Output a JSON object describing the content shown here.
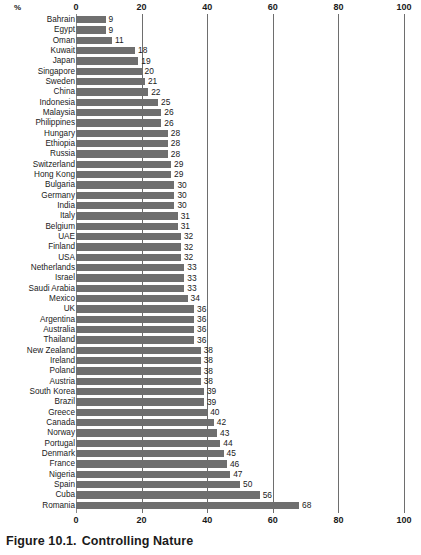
{
  "figure": {
    "caption_number": "Figure 10.1.",
    "caption_title": "Controlling Nature",
    "unit_label": "%"
  },
  "chart_data": {
    "type": "bar",
    "orientation": "horizontal",
    "title": "Controlling Nature",
    "subtitle": "",
    "xlabel": "%",
    "ylabel": "",
    "xlim": [
      0,
      100
    ],
    "xticks": [
      0,
      20,
      40,
      60,
      80,
      100
    ],
    "xtick_labels": [
      "0",
      "20",
      "40",
      "60",
      "80",
      "100"
    ],
    "grid": true,
    "legend": null,
    "bar_color": "#6f6f6f",
    "value_labels_shown": true,
    "categories": [
      "Bahrain",
      "Egypt",
      "Oman",
      "Kuwait",
      "Japan",
      "Singapore",
      "Sweden",
      "China",
      "Indonesia",
      "Malaysia",
      "Philippines",
      "Hungary",
      "Ethiopia",
      "Russia",
      "Switzerland",
      "Hong Kong",
      "Bulgaria",
      "Germany",
      "India",
      "Italy",
      "Belgium",
      "UAE",
      "Finland",
      "USA",
      "Netherlands",
      "Israel",
      "Saudi Arabia",
      "Mexico",
      "UK",
      "Argentina",
      "Australia",
      "Thailand",
      "New Zealand",
      "Ireland",
      "Poland",
      "Austria",
      "South Korea",
      "Brazil",
      "Greece",
      "Canada",
      "Norway",
      "Portugal",
      "Denmark",
      "France",
      "Nigeria",
      "Spain",
      "Cuba",
      "Romania"
    ],
    "values": [
      9,
      9,
      11,
      18,
      19,
      20,
      21,
      22,
      25,
      26,
      26,
      28,
      28,
      28,
      29,
      29,
      30,
      30,
      30,
      31,
      31,
      32,
      32,
      32,
      33,
      33,
      33,
      34,
      36,
      36,
      36,
      36,
      38,
      38,
      38,
      38,
      39,
      39,
      40,
      42,
      43,
      44,
      45,
      46,
      47,
      50,
      56,
      68
    ]
  }
}
